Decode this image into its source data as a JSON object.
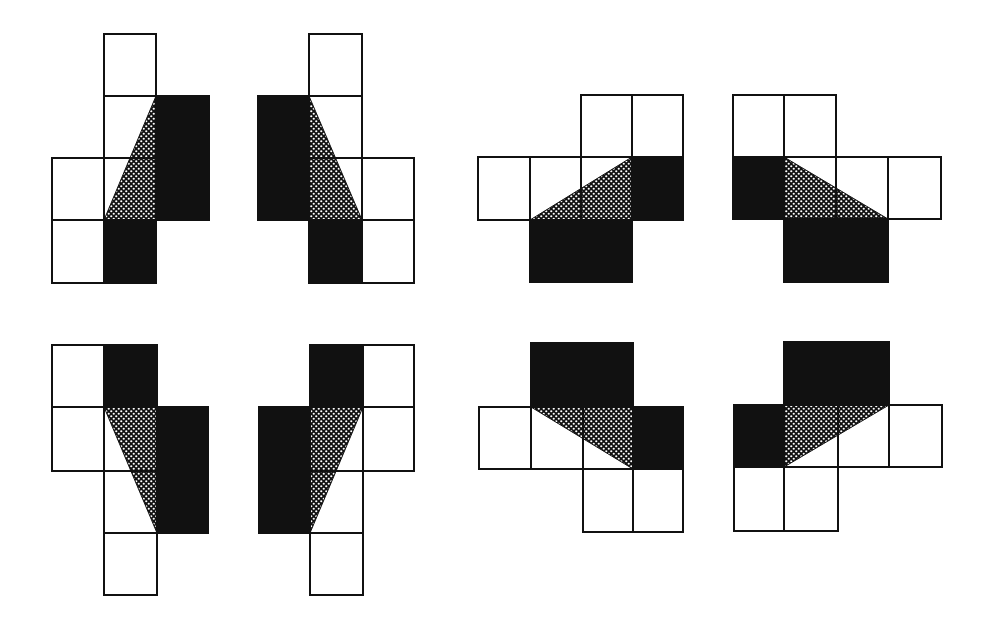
{
  "diagram": {
    "title": "",
    "colors": {
      "background": "#ffffff",
      "filled": "#111111",
      "outline": "#111111",
      "dot": "#ffffff"
    },
    "figures": [
      {
        "id": "fig1",
        "cells": [
          {
            "x": 104,
            "y": 34,
            "w": 52,
            "h": 62,
            "fill": "white"
          },
          {
            "x": 104,
            "y": 96,
            "w": 52,
            "h": 62,
            "fill": "white"
          },
          {
            "x": 156,
            "y": 96,
            "w": 53,
            "h": 62,
            "fill": "black"
          },
          {
            "x": 52,
            "y": 158,
            "w": 52,
            "h": 62,
            "fill": "white"
          },
          {
            "x": 104,
            "y": 158,
            "w": 52,
            "h": 62,
            "fill": "white"
          },
          {
            "x": 156,
            "y": 158,
            "w": 53,
            "h": 62,
            "fill": "black"
          },
          {
            "x": 52,
            "y": 220,
            "w": 52,
            "h": 63,
            "fill": "white"
          },
          {
            "x": 104,
            "y": 220,
            "w": 52,
            "h": 63,
            "fill": "black"
          }
        ],
        "triangle": [
          [
            156,
            96
          ],
          [
            104,
            220
          ],
          [
            156,
            220
          ]
        ]
      },
      {
        "id": "fig2",
        "cells": [
          {
            "x": 309,
            "y": 34,
            "w": 53,
            "h": 62,
            "fill": "white"
          },
          {
            "x": 258,
            "y": 96,
            "w": 51,
            "h": 62,
            "fill": "black"
          },
          {
            "x": 309,
            "y": 96,
            "w": 53,
            "h": 62,
            "fill": "white"
          },
          {
            "x": 258,
            "y": 158,
            "w": 51,
            "h": 62,
            "fill": "black"
          },
          {
            "x": 309,
            "y": 158,
            "w": 53,
            "h": 62,
            "fill": "white"
          },
          {
            "x": 362,
            "y": 158,
            "w": 52,
            "h": 62,
            "fill": "white"
          },
          {
            "x": 309,
            "y": 220,
            "w": 53,
            "h": 63,
            "fill": "black"
          },
          {
            "x": 362,
            "y": 220,
            "w": 52,
            "h": 63,
            "fill": "white"
          }
        ],
        "triangle": [
          [
            309,
            96
          ],
          [
            309,
            220
          ],
          [
            362,
            220
          ]
        ]
      },
      {
        "id": "fig3",
        "cells": [
          {
            "x": 581,
            "y": 95,
            "w": 51,
            "h": 62,
            "fill": "white"
          },
          {
            "x": 632,
            "y": 95,
            "w": 51,
            "h": 62,
            "fill": "white"
          },
          {
            "x": 478,
            "y": 157,
            "w": 52,
            "h": 63,
            "fill": "white"
          },
          {
            "x": 530,
            "y": 157,
            "w": 51,
            "h": 63,
            "fill": "white"
          },
          {
            "x": 581,
            "y": 157,
            "w": 51,
            "h": 63,
            "fill": "white"
          },
          {
            "x": 632,
            "y": 157,
            "w": 51,
            "h": 63,
            "fill": "black"
          },
          {
            "x": 530,
            "y": 220,
            "w": 51,
            "h": 62,
            "fill": "black"
          },
          {
            "x": 581,
            "y": 220,
            "w": 51,
            "h": 62,
            "fill": "black"
          }
        ],
        "triangle": [
          [
            530,
            220
          ],
          [
            632,
            157
          ],
          [
            632,
            220
          ]
        ]
      },
      {
        "id": "fig4",
        "cells": [
          {
            "x": 733,
            "y": 95,
            "w": 51,
            "h": 62,
            "fill": "white"
          },
          {
            "x": 784,
            "y": 95,
            "w": 52,
            "h": 62,
            "fill": "white"
          },
          {
            "x": 733,
            "y": 157,
            "w": 51,
            "h": 62,
            "fill": "black"
          },
          {
            "x": 784,
            "y": 157,
            "w": 52,
            "h": 62,
            "fill": "white"
          },
          {
            "x": 836,
            "y": 157,
            "w": 52,
            "h": 62,
            "fill": "white"
          },
          {
            "x": 888,
            "y": 157,
            "w": 53,
            "h": 62,
            "fill": "white"
          },
          {
            "x": 784,
            "y": 219,
            "w": 52,
            "h": 63,
            "fill": "black"
          },
          {
            "x": 836,
            "y": 219,
            "w": 52,
            "h": 63,
            "fill": "black"
          }
        ],
        "triangle": [
          [
            784,
            157
          ],
          [
            888,
            219
          ],
          [
            784,
            219
          ]
        ]
      },
      {
        "id": "fig5",
        "cells": [
          {
            "x": 52,
            "y": 345,
            "w": 52,
            "h": 62,
            "fill": "white"
          },
          {
            "x": 104,
            "y": 345,
            "w": 53,
            "h": 62,
            "fill": "black"
          },
          {
            "x": 52,
            "y": 407,
            "w": 52,
            "h": 64,
            "fill": "white"
          },
          {
            "x": 104,
            "y": 407,
            "w": 53,
            "h": 64,
            "fill": "white"
          },
          {
            "x": 157,
            "y": 407,
            "w": 51,
            "h": 64,
            "fill": "black"
          },
          {
            "x": 104,
            "y": 471,
            "w": 53,
            "h": 62,
            "fill": "white"
          },
          {
            "x": 157,
            "y": 471,
            "w": 51,
            "h": 62,
            "fill": "black"
          },
          {
            "x": 104,
            "y": 533,
            "w": 53,
            "h": 62,
            "fill": "white"
          }
        ],
        "triangle": [
          [
            104,
            407
          ],
          [
            157,
            407
          ],
          [
            157,
            533
          ]
        ]
      },
      {
        "id": "fig6",
        "cells": [
          {
            "x": 310,
            "y": 345,
            "w": 53,
            "h": 62,
            "fill": "black"
          },
          {
            "x": 363,
            "y": 345,
            "w": 51,
            "h": 62,
            "fill": "white"
          },
          {
            "x": 259,
            "y": 407,
            "w": 51,
            "h": 64,
            "fill": "black"
          },
          {
            "x": 310,
            "y": 407,
            "w": 53,
            "h": 64,
            "fill": "white"
          },
          {
            "x": 363,
            "y": 407,
            "w": 51,
            "h": 64,
            "fill": "white"
          },
          {
            "x": 259,
            "y": 471,
            "w": 51,
            "h": 62,
            "fill": "black"
          },
          {
            "x": 310,
            "y": 471,
            "w": 53,
            "h": 62,
            "fill": "white"
          },
          {
            "x": 310,
            "y": 533,
            "w": 53,
            "h": 62,
            "fill": "white"
          }
        ],
        "triangle": [
          [
            310,
            407
          ],
          [
            363,
            407
          ],
          [
            310,
            533
          ]
        ]
      },
      {
        "id": "fig7",
        "cells": [
          {
            "x": 531,
            "y": 343,
            "w": 52,
            "h": 64,
            "fill": "black"
          },
          {
            "x": 583,
            "y": 343,
            "w": 50,
            "h": 64,
            "fill": "black"
          },
          {
            "x": 479,
            "y": 407,
            "w": 52,
            "h": 62,
            "fill": "white"
          },
          {
            "x": 531,
            "y": 407,
            "w": 52,
            "h": 62,
            "fill": "white"
          },
          {
            "x": 583,
            "y": 407,
            "w": 50,
            "h": 62,
            "fill": "white"
          },
          {
            "x": 633,
            "y": 407,
            "w": 50,
            "h": 62,
            "fill": "black"
          },
          {
            "x": 583,
            "y": 469,
            "w": 50,
            "h": 63,
            "fill": "white"
          },
          {
            "x": 633,
            "y": 469,
            "w": 50,
            "h": 63,
            "fill": "white"
          }
        ],
        "triangle": [
          [
            531,
            407
          ],
          [
            633,
            407
          ],
          [
            633,
            469
          ]
        ]
      },
      {
        "id": "fig8",
        "cells": [
          {
            "x": 784,
            "y": 342,
            "w": 54,
            "h": 63,
            "fill": "black"
          },
          {
            "x": 838,
            "y": 342,
            "w": 51,
            "h": 63,
            "fill": "black"
          },
          {
            "x": 734,
            "y": 405,
            "w": 50,
            "h": 62,
            "fill": "black"
          },
          {
            "x": 784,
            "y": 405,
            "w": 54,
            "h": 62,
            "fill": "white"
          },
          {
            "x": 838,
            "y": 405,
            "w": 51,
            "h": 62,
            "fill": "white"
          },
          {
            "x": 889,
            "y": 405,
            "w": 53,
            "h": 62,
            "fill": "white"
          },
          {
            "x": 734,
            "y": 467,
            "w": 50,
            "h": 64,
            "fill": "white"
          },
          {
            "x": 784,
            "y": 467,
            "w": 54,
            "h": 64,
            "fill": "white"
          }
        ],
        "triangle": [
          [
            784,
            405
          ],
          [
            889,
            405
          ],
          [
            784,
            467
          ]
        ]
      }
    ]
  }
}
